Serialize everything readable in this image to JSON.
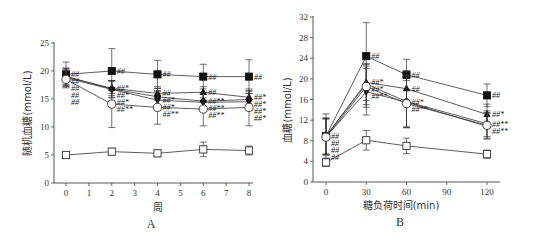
{
  "chart_data": [
    {
      "panel": "A",
      "type": "line",
      "title": "",
      "xlabel": "周",
      "ylabel": "随机血糖(mmol/L)",
      "xlim": [
        -0.5,
        8.5
      ],
      "ylim": [
        0,
        25
      ],
      "xticks": [
        0,
        1,
        2,
        3,
        4,
        5,
        6,
        7,
        8
      ],
      "yticks": [
        0,
        5,
        10,
        15,
        20,
        25
      ],
      "grid": false,
      "x": [
        0,
        2,
        4,
        6,
        8
      ],
      "series": [
        {
          "name": "filled-square",
          "marker": "square-filled",
          "values": [
            19.4,
            20.0,
            19.4,
            19.0,
            19.0
          ],
          "err": [
            2.2,
            4.0,
            2.5,
            2.2,
            3.0
          ],
          "annotations": [
            "##",
            "##",
            "##",
            "##",
            "##"
          ]
        },
        {
          "name": "filled-triangle",
          "marker": "triangle-up-filled",
          "values": [
            19.0,
            16.9,
            16.0,
            16.2,
            15.3
          ],
          "err": [
            1.5,
            1.3,
            1.2,
            1.0,
            1.2
          ],
          "annotations": [
            "##",
            "##*",
            "##",
            "##",
            "##*"
          ]
        },
        {
          "name": "filled-diamond",
          "marker": "diamond-filled",
          "values": [
            19.0,
            16.8,
            15.4,
            14.6,
            14.9
          ],
          "err": [
            1.5,
            1.5,
            1.5,
            1.5,
            1.5
          ],
          "annotations": [
            "##",
            "##*",
            "##*",
            "##**",
            "##*"
          ]
        },
        {
          "name": "filled-triangle-down",
          "marker": "triangle-down-filled",
          "values": [
            18.8,
            16.7,
            14.8,
            14.4,
            14.5
          ],
          "err": [
            1.5,
            1.5,
            1.5,
            1.5,
            1.5
          ],
          "annotations": [
            "##",
            "##*",
            "##*",
            "##**",
            "##*"
          ]
        },
        {
          "name": "open-circle",
          "marker": "circle-open",
          "values": [
            18.5,
            14.1,
            13.5,
            13.2,
            13.5
          ],
          "err": [
            1.5,
            4.2,
            3.0,
            3.0,
            3.3
          ],
          "annotations": [
            "##",
            "##**",
            "##**",
            "##**",
            "##*"
          ]
        },
        {
          "name": "open-square",
          "marker": "square-open",
          "values": [
            5.0,
            5.6,
            5.3,
            6.0,
            5.8
          ],
          "err": [
            0.3,
            0.6,
            0.6,
            1.3,
            0.8
          ],
          "annotations": [
            "",
            "",
            "",
            "",
            ""
          ]
        }
      ]
    },
    {
      "panel": "B",
      "type": "line",
      "title": "",
      "xlabel": "糖负荷时间(min)",
      "ylabel": "血糖(mmol/L)",
      "xlim": [
        -10,
        130
      ],
      "ylim": [
        0,
        32
      ],
      "xticks": [
        0,
        30,
        60,
        90,
        120
      ],
      "yticks": [
        0,
        4,
        8,
        12,
        16,
        20,
        24,
        28,
        32
      ],
      "grid": false,
      "x": [
        0,
        30,
        60,
        120
      ],
      "series": [
        {
          "name": "filled-square",
          "marker": "square-filled",
          "values": [
            8.9,
            24.4,
            20.8,
            16.8
          ],
          "err": [
            4.3,
            6.5,
            3.0,
            2.2
          ],
          "annotations": [
            "##",
            "##",
            "##",
            "##"
          ]
        },
        {
          "name": "filled-triangle",
          "marker": "triangle-up-filled",
          "values": [
            8.9,
            19.3,
            18.1,
            13.1
          ],
          "err": [
            3.5,
            3.5,
            3.5,
            2.0
          ],
          "annotations": [
            "##",
            "##*",
            "##",
            "##*"
          ]
        },
        {
          "name": "filled-diamond",
          "marker": "diamond-filled",
          "values": [
            8.9,
            19.0,
            15.6,
            11.3
          ],
          "err": [
            3.5,
            4.0,
            5.0,
            2.5
          ],
          "annotations": [
            "##",
            "##*",
            "##*",
            "##**"
          ]
        },
        {
          "name": "filled-triangle-down",
          "marker": "triangle-down-filled",
          "values": [
            8.8,
            17.5,
            15.5,
            10.8
          ],
          "err": [
            3.5,
            4.5,
            5.0,
            2.5
          ],
          "annotations": [
            "##",
            "##**",
            "##**",
            "##**"
          ]
        },
        {
          "name": "open-circle",
          "marker": "circle-open",
          "values": [
            8.7,
            18.5,
            15.2,
            11.0
          ],
          "err": [
            3.5,
            4.0,
            4.5,
            2.5
          ],
          "annotations": [
            "",
            "",
            "",
            ""
          ]
        },
        {
          "name": "open-square",
          "marker": "square-open",
          "values": [
            3.8,
            8.1,
            7.0,
            5.4
          ],
          "err": [
            0.8,
            1.9,
            1.5,
            0.8
          ],
          "annotations": [
            "",
            "",
            "",
            ""
          ]
        }
      ]
    }
  ],
  "panels": {
    "A": {
      "label": "A",
      "xlabel": "周",
      "ylabel": "随机血糖(mmol/L)"
    },
    "B": {
      "label": "B",
      "xlabel": "糖负荷时间(min)",
      "ylabel": "血糖(mmol/L)"
    }
  }
}
